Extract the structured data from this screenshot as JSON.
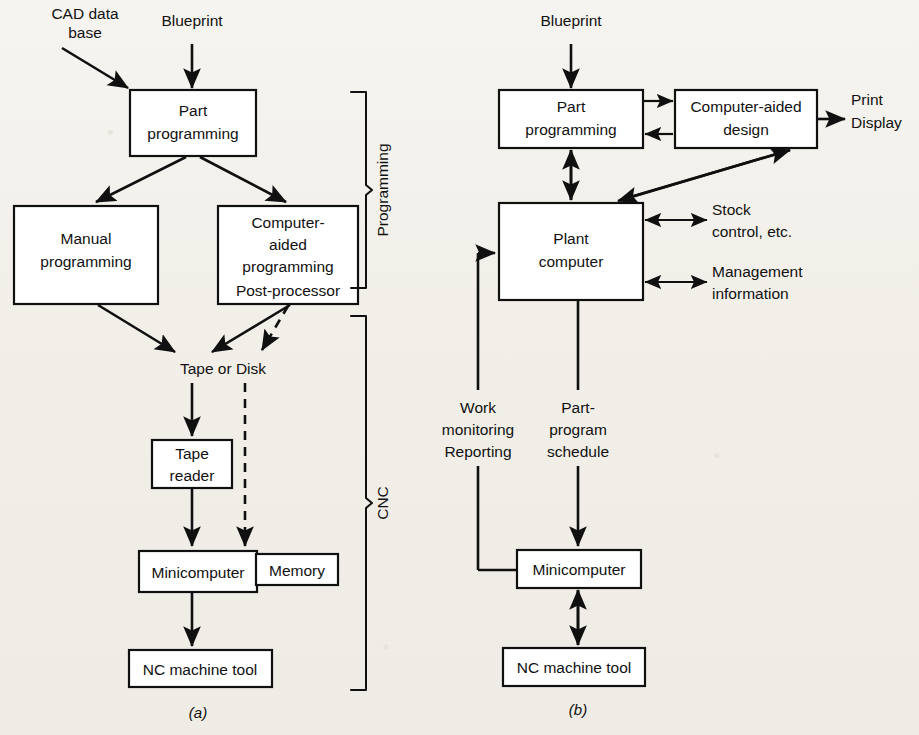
{
  "figure": {
    "caption_a": "(a)",
    "caption_b": "(b)"
  },
  "diagram_a": {
    "name": "Conventional NC / CNC programming flow",
    "inputs": {
      "cad_database": "CAD data\nbase",
      "cad_database_line1": "CAD data",
      "cad_database_line2": "base",
      "blueprint": "Blueprint"
    },
    "boxes": [
      {
        "id": "part-programming",
        "lines": [
          "Part",
          "programming"
        ]
      },
      {
        "id": "manual-programming",
        "lines": [
          "Manual",
          "programming"
        ]
      },
      {
        "id": "computer-aided-programming",
        "lines": [
          "Computer-",
          "aided",
          "programming",
          "Post-processor"
        ]
      },
      {
        "id": "tape-reader",
        "lines": [
          "Tape",
          "reader"
        ]
      },
      {
        "id": "minicomputer",
        "lines": [
          "Minicomputer"
        ]
      },
      {
        "id": "memory",
        "lines": [
          "Memory"
        ]
      },
      {
        "id": "nc-machine-tool",
        "lines": [
          "NC machine tool"
        ]
      }
    ],
    "node_labels": {
      "tape_or_disk": "Tape or Disk"
    },
    "braces": [
      {
        "id": "programming-brace",
        "label": "Programming"
      },
      {
        "id": "cnc-brace",
        "label": "CNC"
      }
    ]
  },
  "diagram_b": {
    "name": "DNC / plant computer programming flow",
    "inputs": {
      "blueprint": "Blueprint"
    },
    "boxes": [
      {
        "id": "part-programming",
        "lines": [
          "Part",
          "programming"
        ]
      },
      {
        "id": "computer-aided-design",
        "lines": [
          "Computer-aided",
          "design"
        ]
      },
      {
        "id": "plant-computer",
        "lines": [
          "Plant",
          "computer"
        ]
      },
      {
        "id": "minicomputer",
        "lines": [
          "Minicomputer"
        ]
      },
      {
        "id": "nc-machine-tool",
        "lines": [
          "NC machine tool"
        ]
      }
    ],
    "outputs": {
      "print_display_line1": "Print",
      "print_display_line2": "Display",
      "stock_control_line1": "Stock",
      "stock_control_line2": "control, etc.",
      "management_line1": "Management",
      "management_line2": "information"
    },
    "edge_labels": {
      "work_monitoring_line1": "Work",
      "work_monitoring_line2": "monitoring",
      "work_monitoring_line3": "Reporting",
      "part_program_line1": "Part-",
      "part_program_line2": "program",
      "part_program_line3": "schedule"
    }
  },
  "colors": {
    "ink": "#101010",
    "paper": "#f2efe9",
    "box_fill": "#ffffff"
  }
}
